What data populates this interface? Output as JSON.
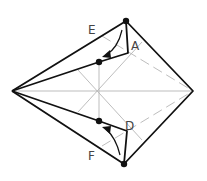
{
  "diagram": {
    "labels": {
      "E": "E",
      "A": "A",
      "D": "D",
      "F": "F"
    },
    "colors": {
      "outline": "#111111",
      "crease": "#aaaaaa",
      "background": "#ffffff"
    }
  }
}
